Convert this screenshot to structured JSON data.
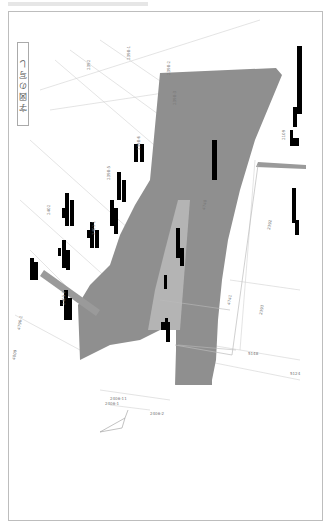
{
  "document": {
    "title": "字図の写し",
    "type": "scanned cadastral map (rotated)"
  },
  "colors": {
    "road_fill": "#8f8f8f",
    "inner_parcel_fill": "#b4b4b4",
    "strip_fill": "#9a9a9a",
    "redaction": "#000000",
    "line": "#c8c8c8",
    "frame": "#bdbdbd"
  },
  "parcel_labels": [
    {
      "text": "2392",
      "x": 90,
      "y": 70
    },
    {
      "text": "2398-1",
      "x": 130,
      "y": 60
    },
    {
      "text": "2398-2",
      "x": 170,
      "y": 75
    },
    {
      "text": "2398-3",
      "x": 176,
      "y": 105
    },
    {
      "text": "2398-6",
      "x": 140,
      "y": 150
    },
    {
      "text": "2398-5",
      "x": 110,
      "y": 180
    },
    {
      "text": "2401-1",
      "x": 95,
      "y": 235
    },
    {
      "text": "2402",
      "x": 50,
      "y": 215
    },
    {
      "text": "2405-2",
      "x": 65,
      "y": 305
    },
    {
      "text": "4740",
      "x": 205,
      "y": 210
    },
    {
      "text": "4741",
      "x": 230,
      "y": 305
    },
    {
      "text": "2392",
      "x": 270,
      "y": 230
    },
    {
      "text": "2393",
      "x": 262,
      "y": 315
    },
    {
      "text": "5148",
      "x": 248,
      "y": 355
    },
    {
      "text": "5124",
      "x": 290,
      "y": 375
    },
    {
      "text": "4796-1",
      "x": 20,
      "y": 330
    },
    {
      "text": "4809",
      "x": 15,
      "y": 360
    },
    {
      "text": "2406-11",
      "x": 110,
      "y": 400
    },
    {
      "text": "2406-1",
      "x": 105,
      "y": 405
    },
    {
      "text": "2406-2",
      "x": 150,
      "y": 415
    },
    {
      "text": "2406-3",
      "x": 160,
      "y": 420
    },
    {
      "text": "2409-1",
      "x": 100,
      "y": 360
    },
    {
      "text": "2109",
      "x": 285,
      "y": 140
    }
  ],
  "legend": {
    "note": "redacted legend block at upper right"
  }
}
